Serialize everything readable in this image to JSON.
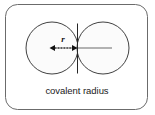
{
  "figure": {
    "caption": "covalent radius",
    "radius_label": "r",
    "frame": {
      "x": 5,
      "y": 4,
      "width": 143,
      "height": 106,
      "corner_radius": 12,
      "stroke_color": "#5a5a5a",
      "fill_color": "#ffffff"
    },
    "atoms": [
      {
        "name": "left-atom",
        "cx": 52,
        "cy": 48,
        "r": 26,
        "fill_color": "#fbfbfb",
        "stroke_color": "#2b2b2b"
      },
      {
        "name": "right-atom",
        "cx": 103,
        "cy": 48,
        "r": 26,
        "fill_color": "#fbfbfb",
        "stroke_color": "#2b2b2b"
      }
    ],
    "bond_axis": {
      "name": "internuclear-line",
      "x1": 52,
      "y1": 48,
      "x2": 112,
      "y2": 48,
      "color": "#9a9a9a"
    },
    "tangent_line": {
      "name": "tangent-plane-line",
      "x": 77.5,
      "y1": 23,
      "y2": 74,
      "color": "#262626"
    },
    "measure_arrow": {
      "name": "radius-measure-arrow",
      "x1": 50,
      "x2": 77,
      "y": 48,
      "style": "double-headed-dotted",
      "color": "#111111"
    },
    "colors": {
      "ink": "#1a1a1a",
      "frame": "#5a5a5a",
      "atom_outline": "#2b2b2b",
      "atom_fill": "#fbfbfb",
      "axis_gray": "#9a9a9a"
    }
  }
}
